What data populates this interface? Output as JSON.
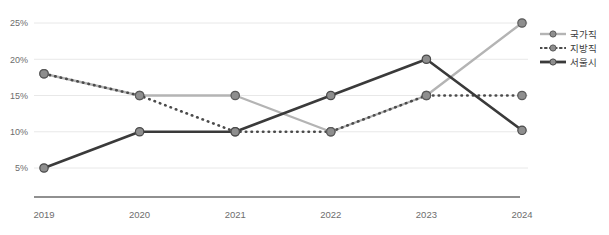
{
  "chart_data": {
    "type": "line",
    "title": "",
    "subtitle": "",
    "xlabel": "",
    "ylabel": "",
    "categories": [
      "2019",
      "2020",
      "2021",
      "2022",
      "2023",
      "2024"
    ],
    "ylim": [
      2.5,
      26.5
    ],
    "yticks": [
      5,
      10,
      15,
      20,
      25
    ],
    "ytick_labels": [
      "5%",
      "10%",
      "15%",
      "20%",
      "25%"
    ],
    "grid": true,
    "legend_position": "right",
    "series": [
      {
        "name": "국가직",
        "values": [
          18,
          15,
          15,
          10,
          15,
          25
        ],
        "line_style": "solid",
        "color": "#b4b4b4",
        "marker_color": "#8e8e8e",
        "marker_edge": "#5a5a5a",
        "width": 2.4
      },
      {
        "name": "지방직",
        "values": [
          18,
          15,
          10,
          10,
          15,
          15
        ],
        "line_style": "dotted",
        "color": "#4a4a4a",
        "marker_color": "#8e8e8e",
        "marker_edge": "#5a5a5a",
        "width": 2.2
      },
      {
        "name": "서울시",
        "values": [
          5,
          10,
          10,
          15,
          20,
          10.2
        ],
        "line_style": "solid",
        "color": "#3a3a3a",
        "marker_color": "#8e8e8e",
        "marker_edge": "#4a4a4a",
        "width": 2.6
      }
    ]
  },
  "legend": {
    "items": [
      {
        "label": "국가직",
        "style": "solid-light"
      },
      {
        "label": "지방직",
        "style": "dotted-dark"
      },
      {
        "label": "서울시",
        "style": "solid-dark"
      }
    ]
  },
  "axes": {
    "y_tick_labels": [
      "25%",
      "20%",
      "15%",
      "10%",
      "5%"
    ],
    "x_tick_labels": [
      "2019",
      "2020",
      "2021",
      "2022",
      "2023",
      "2024"
    ]
  },
  "colors": {
    "gridline": "#e8e8e8",
    "axisline": "#6b6b6b",
    "tick_text": "#6d6d6d",
    "legend_text": "#3b3b3b",
    "background": "#ffffff"
  }
}
